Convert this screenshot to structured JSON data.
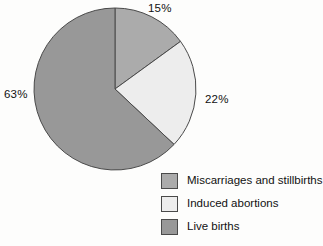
{
  "chart_data": {
    "type": "pie",
    "title": "",
    "categories": [
      "Miscarriages and stillbirths",
      "Induced abortions",
      "Live births"
    ],
    "values": [
      15,
      22,
      63
    ],
    "value_labels": [
      "15%",
      "22%",
      "63%"
    ],
    "unit": "percent",
    "start_angle_deg": 0,
    "direction": "clockwise",
    "legend_position": "bottom-right",
    "grid": false,
    "colors": [
      "#ababab",
      "#ededed",
      "#989898"
    ],
    "slice_outline_color": "#4a4a4a",
    "background_color": "#fdfdfc"
  },
  "pie": {
    "slices": [
      {
        "label": "15%",
        "name": "Miscarriages and stillbirths",
        "value": 15,
        "color": "#ababab"
      },
      {
        "label": "22%",
        "name": "Induced abortions",
        "value": 22,
        "color": "#ededed"
      },
      {
        "label": "63%",
        "name": "Live births",
        "value": 63,
        "color": "#989898"
      }
    ]
  },
  "legend": {
    "items": [
      {
        "label": "Miscarriages and stillbirths",
        "color": "#ababab"
      },
      {
        "label": "Induced abortions",
        "color": "#ededed"
      },
      {
        "label": "Live births",
        "color": "#989898"
      }
    ]
  }
}
